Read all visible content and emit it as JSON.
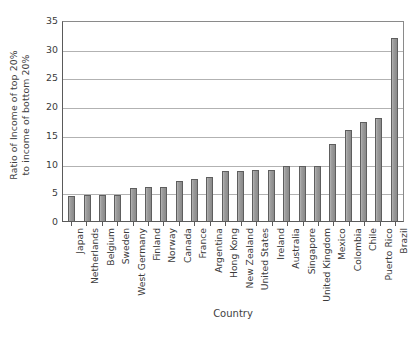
{
  "chart_data": {
    "type": "bar",
    "title": "",
    "xlabel": "Country",
    "ylabel": "Ratio of Income of top 20% to income of bottom 20%",
    "ylabel_line1": "Ratio of Income of top 20%",
    "ylabel_line2": "to income of bottom 20%",
    "ylim": [
      0,
      35
    ],
    "ytick_step": 5,
    "yticks": [
      0,
      5,
      10,
      15,
      20,
      25,
      30,
      35
    ],
    "ytick_labels": [
      "0",
      "5",
      "10",
      "15",
      "20",
      "25",
      "30",
      "35"
    ],
    "grid": true,
    "grid_axis": "y",
    "legend": false,
    "legend_position": "none",
    "orientation": "vertical",
    "bar_color": "#969696",
    "bar_edge_color": "#5e5e5e",
    "grid_color": "#b2b2b2",
    "axis_color": "#5a5a5a",
    "background_color": "#ffffff",
    "categories": [
      "Japan",
      "Netherlands",
      "Belgium",
      "Sweden",
      "West Germany",
      "Finland",
      "Norway",
      "Canada",
      "France",
      "Argentina",
      "Hong Kong",
      "New Zealand",
      "United States",
      "Ireland",
      "Australia",
      "Singapore",
      "United Kingdom",
      "Mexico",
      "Colombia",
      "Chile",
      "Puerto Rico",
      "Brazil"
    ],
    "values": [
      4.3,
      4.5,
      4.6,
      4.6,
      5.7,
      5.9,
      5.9,
      7.0,
      7.4,
      7.7,
      8.7,
      8.7,
      8.8,
      8.9,
      9.5,
      9.5,
      9.5,
      13.4,
      15.8,
      17.2,
      18.0,
      31.8
    ]
  }
}
